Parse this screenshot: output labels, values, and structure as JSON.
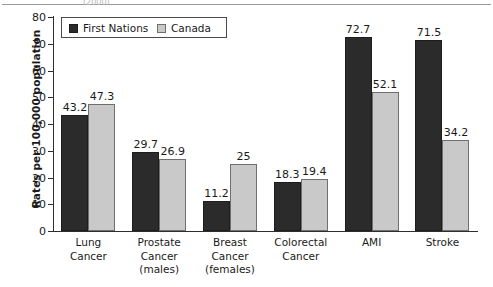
{
  "figure": {
    "top_artifact_text": "(2000)"
  },
  "legend": {
    "position": "top-left-inside",
    "entries": [
      {
        "label": "First Nations",
        "color": "#2b2b2b",
        "swatch": "filled-square-icon"
      },
      {
        "label": "Canada",
        "color": "#c9c9c9",
        "swatch": "filled-square-icon"
      }
    ]
  },
  "axes": {
    "ylabel": "Rates per 100,000 population",
    "xlabel": "",
    "yticks": [
      0,
      10,
      20,
      30,
      40,
      50,
      60,
      70,
      80
    ],
    "ytick_labels": [
      "0",
      "10",
      "20",
      "30",
      "40",
      "50",
      "60",
      "70",
      "80"
    ],
    "ylim": [
      0,
      80
    ],
    "grid": "off"
  },
  "chart_data": {
    "type": "bar",
    "title": "",
    "subtitle": "",
    "xlabel": "",
    "ylabel": "Rates per 100,000 population",
    "ylim": [
      0,
      80
    ],
    "grid": false,
    "legend_position": "upper left",
    "categories": [
      "Lung\nCancer",
      "Prostate\nCancer\n(males)",
      "Breast\nCancer\n(females)",
      "Colorectal\nCancer",
      "AMI",
      "Stroke"
    ],
    "category_labels_flat": [
      "Lung Cancer",
      "Prostate Cancer (males)",
      "Breast Cancer (females)",
      "Colorectal Cancer",
      "AMI",
      "Stroke"
    ],
    "series": [
      {
        "name": "First Nations",
        "color": "#2b2b2b",
        "values": [
          43.2,
          29.7,
          11.2,
          18.3,
          72.7,
          71.5
        ],
        "value_labels": [
          "43.2",
          "29.7",
          "11.2",
          "18.3",
          "72.7",
          "71.5"
        ]
      },
      {
        "name": "Canada",
        "color": "#c9c9c9",
        "values": [
          47.3,
          26.9,
          25,
          19.4,
          52.1,
          34.2
        ],
        "value_labels": [
          "47.3",
          "26.9",
          "25",
          "19.4",
          "52.1",
          "34.2"
        ]
      }
    ]
  }
}
